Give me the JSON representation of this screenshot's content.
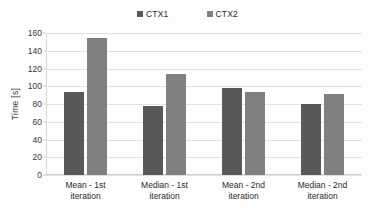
{
  "chart_data": {
    "type": "bar",
    "title": "",
    "xlabel": "",
    "ylabel": "Time [s]",
    "ylim": [
      0,
      160
    ],
    "ytick_step": 20,
    "yticks": [
      "160",
      "140",
      "120",
      "100",
      "80",
      "60",
      "40",
      "20",
      "0"
    ],
    "grid": true,
    "legend_position": "top-center",
    "categories": [
      "Mean - 1st iteration",
      "Median - 1st iteration",
      "Mean - 2nd iteration",
      "Median - 2nd iteration"
    ],
    "category_lines": [
      [
        "Mean - 1st",
        "iteration"
      ],
      [
        "Median - 1st",
        "iteration"
      ],
      [
        "Mean - 2nd",
        "iteration"
      ],
      [
        "Median - 2nd",
        "iteration"
      ]
    ],
    "series": [
      {
        "name": "CTX1",
        "color": "#595959",
        "values": [
          94,
          78,
          98,
          80
        ]
      },
      {
        "name": "CTX2",
        "color": "#808080",
        "values": [
          154,
          114,
          93,
          91
        ]
      }
    ]
  }
}
